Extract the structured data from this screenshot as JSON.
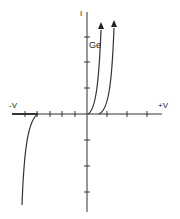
{
  "diagram": {
    "labels": {
      "y_axis": "I",
      "neg_x": "-V",
      "pos_x": "+V",
      "curve_ge": "Ge"
    },
    "colors": {
      "line": "#333333",
      "background": "#ffffff"
    },
    "axes": {
      "origin": [
        87,
        114
      ],
      "x_range_px": [
        12,
        162
      ],
      "y_range_px": [
        12,
        212
      ],
      "x_ticks_px": [
        25,
        37,
        50,
        62,
        75,
        107,
        127,
        147
      ],
      "y_ticks_px": [
        37,
        62,
        88,
        140,
        166,
        192
      ]
    },
    "curves": [
      {
        "name": "Ge",
        "type": "forward",
        "arrow": true
      },
      {
        "name": "second-diode",
        "type": "forward",
        "arrow": true
      },
      {
        "name": "reverse-breakdown",
        "type": "reverse",
        "arrow": false
      }
    ]
  }
}
